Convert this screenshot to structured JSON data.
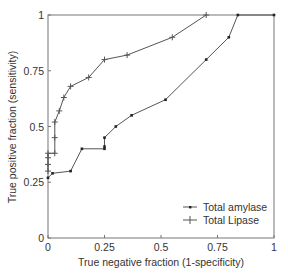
{
  "chart_data": {
    "type": "line",
    "title": "",
    "xlabel": "True negative fraction (1-specificity)",
    "ylabel": "True positive fraction (sensitivity)",
    "xlim": [
      0,
      1
    ],
    "ylim": [
      0,
      1
    ],
    "xticks": [
      "0",
      "0.25",
      "0.5",
      "0.75",
      "1"
    ],
    "yticks": [
      "0",
      "0.25",
      "0.5",
      "0.75",
      "1"
    ],
    "grid": false,
    "legend_position": "lower right",
    "series": [
      {
        "name": "Total amylase",
        "marker": "dot",
        "x": [
          0,
          0.02,
          0.1,
          0.15,
          0.25,
          0.25,
          0.25,
          0.3,
          0.37,
          0.52,
          0.7,
          0.8,
          0.84,
          1.0
        ],
        "y": [
          0.27,
          0.29,
          0.3,
          0.4,
          0.4,
          0.41,
          0.45,
          0.5,
          0.55,
          0.62,
          0.8,
          0.9,
          1.0,
          1.0
        ]
      },
      {
        "name": "Total Lipase",
        "marker": "plus",
        "x": [
          0,
          0,
          0,
          0,
          0.03,
          0.03,
          0.03,
          0.05,
          0.07,
          0.1,
          0.18,
          0.25,
          0.35,
          0.55,
          0.7
        ],
        "y": [
          0.3,
          0.33,
          0.36,
          0.38,
          0.38,
          0.45,
          0.52,
          0.57,
          0.63,
          0.68,
          0.72,
          0.8,
          0.82,
          0.9,
          1.0
        ]
      }
    ]
  },
  "legend": {
    "items": [
      "Total amylase",
      "Total Lipase"
    ]
  },
  "colors": {
    "line": "#555555",
    "axis": "#777777",
    "text": "#333333"
  }
}
